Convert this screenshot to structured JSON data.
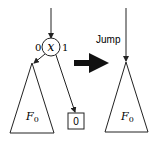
{
  "diagram": {
    "left": {
      "node_label": "x",
      "edge_zero_label": "0",
      "edge_one_label": "1",
      "subtree_label": "F",
      "subtree_subscript": "0",
      "terminal_label": "0"
    },
    "transform_arrow": "right-arrow-icon",
    "right": {
      "edge_label": "Jump",
      "subtree_label": "F",
      "subtree_subscript": "0"
    },
    "colors": {
      "stroke": "#222222",
      "fill": "#ffffff"
    }
  }
}
